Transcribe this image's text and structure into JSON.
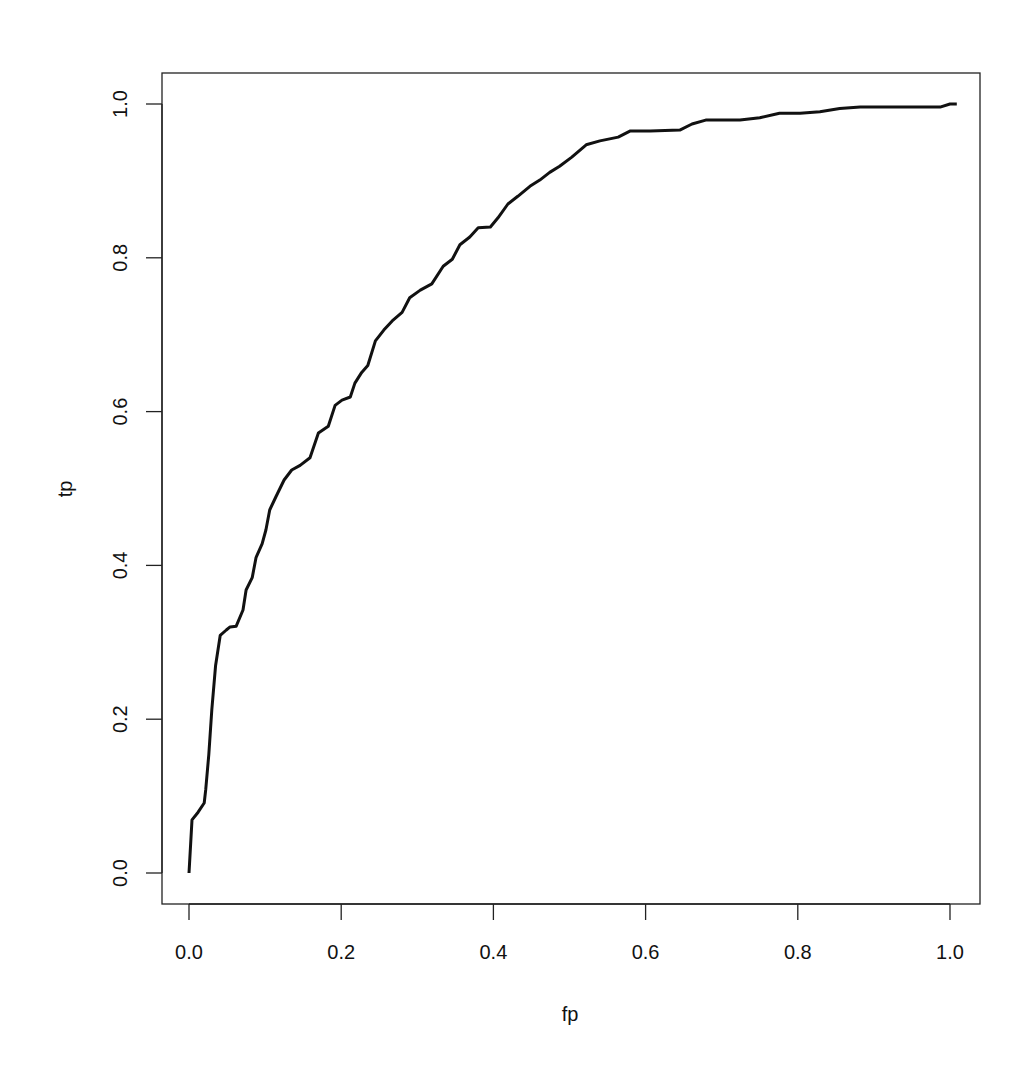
{
  "chart_data": {
    "type": "line",
    "title": "",
    "xlabel": "fp",
    "ylabel": "tp",
    "xlim": [
      0,
      1
    ],
    "ylim": [
      0,
      1
    ],
    "grid": false,
    "legend": null,
    "x_ticks": [
      "0.0",
      "0.2",
      "0.4",
      "0.6",
      "0.8",
      "1.0"
    ],
    "y_ticks": [
      "0.0",
      "0.2",
      "0.4",
      "0.6",
      "0.8",
      "1.0"
    ],
    "series": [
      {
        "name": "ROC curve",
        "color": "#111111",
        "points": [
          [
            0.0,
            0.0
          ],
          [
            0.004,
            0.069
          ],
          [
            0.012,
            0.079
          ],
          [
            0.02,
            0.091
          ],
          [
            0.022,
            0.108
          ],
          [
            0.026,
            0.154
          ],
          [
            0.03,
            0.212
          ],
          [
            0.035,
            0.27
          ],
          [
            0.041,
            0.309
          ],
          [
            0.049,
            0.316
          ],
          [
            0.054,
            0.32
          ],
          [
            0.062,
            0.321
          ],
          [
            0.071,
            0.342
          ],
          [
            0.075,
            0.368
          ],
          [
            0.083,
            0.384
          ],
          [
            0.088,
            0.41
          ],
          [
            0.096,
            0.428
          ],
          [
            0.101,
            0.446
          ],
          [
            0.106,
            0.472
          ],
          [
            0.114,
            0.489
          ],
          [
            0.125,
            0.511
          ],
          [
            0.135,
            0.524
          ],
          [
            0.146,
            0.53
          ],
          [
            0.159,
            0.54
          ],
          [
            0.17,
            0.572
          ],
          [
            0.183,
            0.581
          ],
          [
            0.192,
            0.608
          ],
          [
            0.201,
            0.615
          ],
          [
            0.212,
            0.619
          ],
          [
            0.218,
            0.637
          ],
          [
            0.227,
            0.651
          ],
          [
            0.235,
            0.66
          ],
          [
            0.245,
            0.692
          ],
          [
            0.256,
            0.706
          ],
          [
            0.267,
            0.718
          ],
          [
            0.28,
            0.729
          ],
          [
            0.29,
            0.748
          ],
          [
            0.304,
            0.758
          ],
          [
            0.319,
            0.766
          ],
          [
            0.334,
            0.789
          ],
          [
            0.346,
            0.798
          ],
          [
            0.356,
            0.817
          ],
          [
            0.369,
            0.827
          ],
          [
            0.38,
            0.839
          ],
          [
            0.396,
            0.84
          ],
          [
            0.406,
            0.852
          ],
          [
            0.419,
            0.87
          ],
          [
            0.432,
            0.88
          ],
          [
            0.448,
            0.893
          ],
          [
            0.461,
            0.901
          ],
          [
            0.474,
            0.911
          ],
          [
            0.487,
            0.919
          ],
          [
            0.503,
            0.931
          ],
          [
            0.522,
            0.947
          ],
          [
            0.54,
            0.952
          ],
          [
            0.564,
            0.957
          ],
          [
            0.58,
            0.965
          ],
          [
            0.606,
            0.965
          ],
          [
            0.645,
            0.966
          ],
          [
            0.661,
            0.974
          ],
          [
            0.679,
            0.979
          ],
          [
            0.724,
            0.979
          ],
          [
            0.75,
            0.982
          ],
          [
            0.776,
            0.988
          ],
          [
            0.803,
            0.988
          ],
          [
            0.829,
            0.99
          ],
          [
            0.855,
            0.994
          ],
          [
            0.882,
            0.996
          ],
          [
            0.934,
            0.996
          ],
          [
            0.987,
            0.996
          ],
          [
            1.0,
            1.0
          ],
          [
            1.009,
            1.0
          ]
        ]
      }
    ],
    "plot_px": {
      "x0": 189,
      "x1": 950,
      "y0": 873,
      "y1": 104,
      "box": {
        "left": 162,
        "top": 73,
        "right": 980,
        "bottom": 904
      }
    }
  }
}
